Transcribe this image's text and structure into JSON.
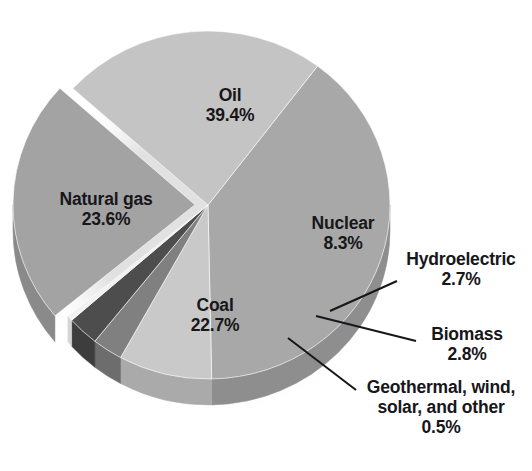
{
  "chart_data": {
    "type": "pie",
    "title": "",
    "subtitle": "",
    "xlabel": "",
    "ylabel": "",
    "legend_position": "none",
    "grid": false,
    "style": "3d-exploded-grayscale",
    "units": "percent",
    "categories": [
      "Oil",
      "Natural gas",
      "Coal",
      "Nuclear",
      "Hydroelectric",
      "Biomass",
      "Geothermal, wind, solar, and other"
    ],
    "values": [
      39.4,
      23.6,
      22.7,
      8.3,
      2.7,
      2.8,
      0.5
    ],
    "slices": [
      {
        "id": "oil",
        "label": "Oil",
        "value_text": "39.4%",
        "value": 39.4,
        "color": "#a8a8a8",
        "side_color": "#8e8e8e",
        "label_placement": "inside",
        "start_angle_deg": -53.0,
        "sweep_deg": 141.84
      },
      {
        "id": "nuclear",
        "label": "Nuclear",
        "value_text": "8.3%",
        "value": 8.3,
        "color": "#c9c9c9",
        "side_color": "#aaaaaa",
        "label_placement": "inside",
        "start_angle_deg": 88.84,
        "sweep_deg": 29.88
      },
      {
        "id": "hydroelectric",
        "label": "Hydroelectric",
        "value_text": "2.7%",
        "value": 2.7,
        "color": "#808080",
        "side_color": "#6d6d6d",
        "label_placement": "callout-right",
        "start_angle_deg": 118.72,
        "sweep_deg": 9.72
      },
      {
        "id": "biomass",
        "label": "Biomass",
        "value_text": "2.8%",
        "value": 2.8,
        "color": "#4d4d4d",
        "side_color": "#3d3d3d",
        "label_placement": "callout-right",
        "start_angle_deg": 128.44,
        "sweep_deg": 10.08
      },
      {
        "id": "geothermal",
        "label": "Geothermal, wind,",
        "label_line2": "solar, and other",
        "value_text": "0.5%",
        "value": 0.5,
        "color": "#f1f1f1",
        "side_color": "#d6d6d6",
        "label_placement": "callout-right",
        "start_angle_deg": 138.52,
        "sweep_deg": 1.8
      },
      {
        "id": "coal",
        "label": "Coal",
        "value_text": "22.7%",
        "value": 22.7,
        "color": "#a3a3a3",
        "side_color": "#8a8a8a",
        "label_placement": "inside",
        "start_angle_deg": 140.32,
        "sweep_deg": 81.72,
        "exploded": true
      },
      {
        "id": "natural-gas",
        "label": "Natural gas",
        "value_text": "23.6%",
        "value": 23.6,
        "color": "#c4c4c4",
        "side_color": "#a5a5a5",
        "label_placement": "inside",
        "start_angle_deg": 222.04,
        "sweep_deg": 84.96
      }
    ],
    "callouts": [
      {
        "id": "hydroelectric",
        "from_x": 397,
        "from_y": 281,
        "to_x": 330,
        "to_y": 311
      },
      {
        "id": "biomass",
        "from_x": 416,
        "from_y": 341,
        "to_x": 316,
        "to_y": 316
      },
      {
        "id": "geothermal",
        "from_x": 356,
        "from_y": 390,
        "to_x": 288,
        "to_y": 338
      }
    ]
  },
  "labels": {
    "oil": {
      "name": "Oil",
      "value": "39.4%"
    },
    "natural_gas": {
      "name": "Natural gas",
      "value": "23.6%"
    },
    "coal": {
      "name": "Coal",
      "value": "22.7%"
    },
    "nuclear": {
      "name": "Nuclear",
      "value": "8.3%"
    },
    "hydroelectric": {
      "name": "Hydroelectric",
      "value": "2.7%"
    },
    "biomass": {
      "name": "Biomass",
      "value": "2.8%"
    },
    "geothermal": {
      "name": "Geothermal, wind,",
      "name2": "solar, and other",
      "value": "0.5%"
    }
  }
}
